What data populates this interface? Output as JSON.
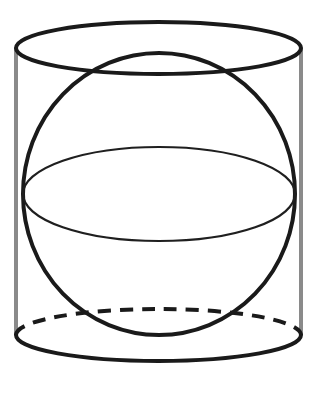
{
  "figure": {
    "title": "Sphere inscribed in a cylinder",
    "type": "geometric-solid-diagram",
    "background_color": "#ffffff",
    "canvas": {
      "width": 318,
      "height": 393
    }
  },
  "style": {
    "outline_color": "#1a1a1a",
    "outline_width": 4,
    "hidden_edge_color": "#1a1a1a",
    "hidden_edge_width": 4,
    "hidden_edge_dash": "13 9",
    "vertical_edge_color": "#8a8a8a",
    "vertical_edge_width": 4,
    "equator_color": "#1f1f1f",
    "equator_width": 2.2,
    "fill": "none"
  },
  "shapes": {
    "cylinder": {
      "name": "cylinder",
      "center_x": 158.5,
      "radius_x": 142.5,
      "radius_y": 26,
      "top_center_y": 48,
      "bottom_center_y": 335,
      "height": 287,
      "left_edge_x": 16,
      "right_edge_x": 301,
      "top_ellipse_visible": "full",
      "bottom_ellipse_front": "solid",
      "bottom_ellipse_back": "dashed"
    },
    "sphere": {
      "name": "sphere",
      "center_x": 159,
      "center_y": 194,
      "radius_x": 136,
      "radius_y": 141,
      "top_y": 53,
      "bottom_y": 335,
      "left_x": 23,
      "right_x": 295
    },
    "equator": {
      "name": "sphere-equator-ellipse",
      "center_x": 159,
      "center_y": 194,
      "radius_x": 136,
      "radius_y": 47
    }
  },
  "paths": {
    "cylinder_top_ellipse": "M 16,48 A 142.5,26 0 0,1 301,48 A 142.5,26 0 0,1 16,48 Z",
    "cylinder_left_edge": "M 16,48 L 16,335",
    "cylinder_right_edge": "M 301,48 L 301,335",
    "cylinder_bottom_front": "M 16,335 A 142.5,26 0 0,0 301,335",
    "cylinder_bottom_back": "M 16,335 A 142.5,26 0 0,1 301,335",
    "sphere_outline": "M 159,53 A 136,141 0 0,1 159,335 A 136,141 0 0,1 159,53 Z",
    "equator_ellipse": "M 23,194 A 136,47 0 0,1 295,194 A 136,47 0 0,1 23,194 Z"
  }
}
